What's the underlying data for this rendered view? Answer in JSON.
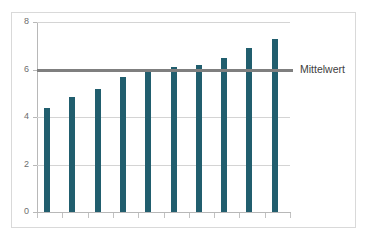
{
  "chart_data": {
    "type": "bar",
    "title": "",
    "xlabel": "",
    "ylabel": "",
    "categories": [
      "1",
      "2",
      "3",
      "4",
      "5",
      "6",
      "7",
      "8",
      "9",
      "10"
    ],
    "values": [
      4.4,
      4.85,
      5.2,
      5.7,
      5.9,
      6.1,
      6.2,
      6.5,
      6.9,
      7.3
    ],
    "series": [
      {
        "name": "Werte",
        "values": [
          4.4,
          4.85,
          5.2,
          5.7,
          5.9,
          6.1,
          6.2,
          6.5,
          6.9,
          7.3
        ],
        "color": "#215e6e"
      }
    ],
    "reference_lines": [
      {
        "name": "Mittelwert",
        "label": "Mittelwert",
        "value": 6.0,
        "color": "#7f7f7f"
      }
    ],
    "ylim": [
      0,
      8
    ],
    "ytick_labels": [
      "0",
      "2",
      "4",
      "6",
      "8"
    ],
    "ytick_values": [
      0,
      2,
      4,
      6,
      8
    ],
    "xtick_labels": [],
    "grid": "horizontal",
    "legend": "none",
    "annotations": [
      {
        "text": "Mittelwert",
        "x": 6.0,
        "y": 6.0
      }
    ]
  },
  "colors": {
    "bar": "#215e6e",
    "mean_line": "#7f7f7f",
    "gridline": "#d4d4d4",
    "axis": "#b8b8b8",
    "frame": "#d9d9d9",
    "tick_label": "#6d6d6d",
    "annotation_text": "#404040",
    "background": "#ffffff"
  }
}
